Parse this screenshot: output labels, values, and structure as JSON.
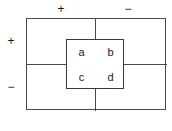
{
  "diagram": {
    "type": "quadrant-contingency-diagram",
    "axis_labels": {
      "top_left": "+",
      "top_right": "−",
      "left_top": "+",
      "left_bottom": "−"
    },
    "inner_table": {
      "rows": [
        [
          "a",
          "b"
        ],
        [
          "c",
          "d"
        ]
      ],
      "cells": {
        "top_left": "a",
        "top_right": "b",
        "bottom_left": "c",
        "bottom_right": "d"
      }
    },
    "colors": {
      "outer_border": "#4a4a4a",
      "inner_border": "#3a3a3a",
      "divider": "#4a4a4a",
      "text": "#1a1a1a",
      "background": "#ffffff"
    }
  }
}
